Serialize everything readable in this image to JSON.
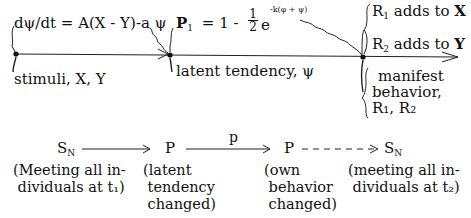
{
  "top_diagram": {
    "equation_dpsi": "dψ/dt = A(X - Y)-a ψ",
    "equation_p1_lhs": "P",
    "equation_p1_sub": "1",
    "equation_p1_mid": "= 1 -",
    "equation_p1_frac_num": "1",
    "equation_p1_frac_den": "2",
    "equation_p1_e": "e",
    "equation_p1_exp": "-k(φ + ψ)",
    "node1_label": "stimuli, X, Y",
    "node2_label": "latent tendency, ψ",
    "node3_label_lines": [
      "manifest",
      "behavior,",
      "R₁, R₂"
    ],
    "r1_text": "R",
    "r1_sub": "1",
    "r1_rest": "adds to",
    "r1_target": "X",
    "r2_text": "R",
    "r2_sub": "2",
    "r2_rest": "adds to",
    "r2_target": "Y"
  },
  "bottom_diagram": {
    "sn1": "S",
    "sn1_sub": "N",
    "p1": "P",
    "arrow_label": "p",
    "p2": "P",
    "sn2": "S",
    "sn2_sub": "N",
    "caption1": "(Meeting all in-\n dividuals at t₁)",
    "caption2": "(latent\n tendency\n changed)",
    "caption3": "(own\n behavior\n changed)",
    "caption4": "(meeting all in-\n dividuals at t₂)"
  }
}
